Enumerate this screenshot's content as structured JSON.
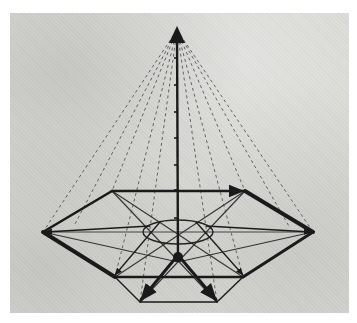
{
  "figure": {
    "kind": "photograph of hand-drawn geometric vector diagram",
    "colors": {
      "background": "#ffffff",
      "paper": "#d9d9d6",
      "ink": "#1a1a1a",
      "faint_ink": "#555555"
    }
  },
  "geometry": {
    "apex": [
      177,
      28
    ],
    "axis_bottom": [
      178,
      262
    ],
    "axis_ticks_y": [
      58,
      85,
      112,
      138,
      165,
      190,
      218
    ],
    "hexagon": {
      "left": [
        43,
        232
      ],
      "upper_left": [
        112,
        191
      ],
      "upper_right": [
        245,
        191
      ],
      "right": [
        313,
        232
      ],
      "lower_right": [
        243,
        277
      ],
      "lower_left": [
        115,
        277
      ]
    },
    "bottom_vertices": [
      [
        140,
        302
      ],
      [
        217,
        302
      ]
    ],
    "ellipse": {
      "cx": 178,
      "cy": 232,
      "rx": 35,
      "ry": 12
    }
  }
}
